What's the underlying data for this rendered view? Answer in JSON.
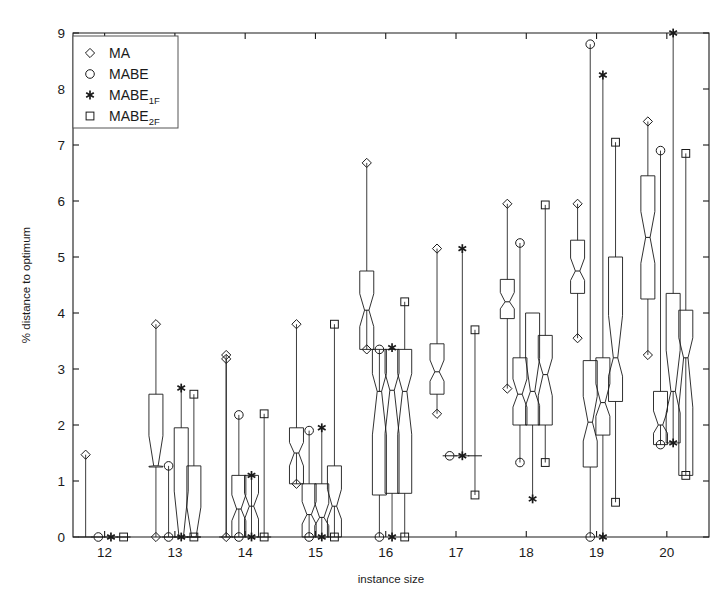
{
  "chart_data": {
    "type": "box",
    "title": "",
    "xlabel": "instance size",
    "ylabel": "% distance to optimum",
    "xlim": [
      11.55,
      20.6
    ],
    "ylim": [
      0,
      9
    ],
    "yticks": [
      0,
      1,
      2,
      3,
      4,
      5,
      6,
      7,
      8,
      9
    ],
    "xticks": [
      12,
      13,
      14,
      15,
      16,
      17,
      18,
      19,
      20
    ],
    "categories": [
      "12",
      "13",
      "14",
      "15",
      "16",
      "17",
      "18",
      "19",
      "20"
    ],
    "grid": false,
    "notched": true,
    "legend": {
      "position": "top-left",
      "entries": [
        {
          "label": "MA",
          "marker": "diamond",
          "sub": ""
        },
        {
          "label": "MABE",
          "marker": "circle",
          "sub": ""
        },
        {
          "label": "MABE",
          "marker": "asterisk",
          "sub": "1F"
        },
        {
          "label": "MABE",
          "marker": "square",
          "sub": "2F"
        }
      ]
    },
    "series": [
      {
        "name": "MA",
        "marker": "diamond",
        "offset": -0.27
      },
      {
        "name": "MABE",
        "marker": "circle",
        "offset": -0.09
      },
      {
        "name": "MABE_1F",
        "marker": "asterisk",
        "offset": 0.09
      },
      {
        "name": "MABE_2F",
        "marker": "square",
        "offset": 0.27
      }
    ],
    "boxes": [
      {
        "group": 12,
        "series": "MA",
        "q1": 0.0,
        "median": 0.0,
        "q3": 0.0,
        "wlo": 0.0,
        "whi": 0.0,
        "outliers": [
          1.47
        ]
      },
      {
        "group": 12,
        "series": "MABE",
        "q1": 0.0,
        "median": 0.0,
        "q3": 0.0,
        "wlo": 0.0,
        "whi": 0.0,
        "outliers": [
          0.0
        ]
      },
      {
        "group": 12,
        "series": "MABE_1F",
        "q1": 0.0,
        "median": 0.0,
        "q3": 0.0,
        "wlo": 0.0,
        "whi": 0.0,
        "outliers": [
          0.0
        ]
      },
      {
        "group": 12,
        "series": "MABE_2F",
        "q1": 0.0,
        "median": 0.0,
        "q3": 0.0,
        "wlo": 0.0,
        "whi": 0.0,
        "outliers": [
          0.0
        ]
      },
      {
        "group": 13,
        "series": "MA",
        "q1": 1.25,
        "median": 1.27,
        "q3": 2.55,
        "wlo": 0.0,
        "whi": 2.55,
        "outliers": [
          3.8,
          0.0
        ]
      },
      {
        "group": 13,
        "series": "MABE",
        "q1": 0.0,
        "median": 0.0,
        "q3": 0.0,
        "wlo": 0.0,
        "whi": 0.0,
        "outliers": [
          1.27,
          0.0
        ]
      },
      {
        "group": 13,
        "series": "MABE_1F",
        "q1": 0.0,
        "median": 0.0,
        "q3": 1.95,
        "wlo": 0.0,
        "whi": 1.95,
        "outliers": [
          2.66,
          0.0
        ]
      },
      {
        "group": 13,
        "series": "MABE_2F",
        "q1": 0.0,
        "median": 0.0,
        "q3": 1.27,
        "wlo": 0.0,
        "whi": 1.27,
        "outliers": [
          2.55,
          0.0
        ]
      },
      {
        "group": 14,
        "series": "MA",
        "q1": 0.0,
        "median": 0.0,
        "q3": 0.0,
        "wlo": 0.0,
        "whi": 0.0,
        "outliers": [
          3.25,
          3.18,
          0.0
        ]
      },
      {
        "group": 14,
        "series": "MABE",
        "q1": 0.0,
        "median": 0.5,
        "q3": 1.1,
        "wlo": 0.0,
        "whi": 1.1,
        "outliers": [
          2.18,
          0.0
        ]
      },
      {
        "group": 14,
        "series": "MABE_1F",
        "q1": 0.0,
        "median": 0.55,
        "q3": 1.1,
        "wlo": 0.0,
        "whi": 1.1,
        "outliers": [
          1.1,
          0.0
        ]
      },
      {
        "group": 14,
        "series": "MABE_2F",
        "q1": 0.0,
        "median": 0.0,
        "q3": 0.0,
        "wlo": 0.0,
        "whi": 0.0,
        "outliers": [
          2.2,
          0.0
        ]
      },
      {
        "group": 15,
        "series": "MA",
        "q1": 0.95,
        "median": 1.5,
        "q3": 1.95,
        "wlo": 0.95,
        "whi": 1.95,
        "outliers": [
          3.8,
          0.95
        ]
      },
      {
        "group": 15,
        "series": "MABE",
        "q1": 0.0,
        "median": 0.4,
        "q3": 0.95,
        "wlo": 0.0,
        "whi": 0.95,
        "outliers": [
          1.9,
          0.0
        ]
      },
      {
        "group": 15,
        "series": "MABE_1F",
        "q1": 0.0,
        "median": 0.35,
        "q3": 0.95,
        "wlo": 0.0,
        "whi": 0.95,
        "outliers": [
          1.95,
          0.0
        ]
      },
      {
        "group": 15,
        "series": "MABE_2F",
        "q1": 0.0,
        "median": 0.55,
        "q3": 1.27,
        "wlo": 0.0,
        "whi": 1.27,
        "outliers": [
          3.8,
          0.0
        ]
      },
      {
        "group": 16,
        "series": "MA",
        "q1": 3.35,
        "median": 4.05,
        "q3": 4.75,
        "wlo": 3.35,
        "whi": 4.75,
        "outliers": [
          6.68,
          3.35
        ]
      },
      {
        "group": 16,
        "series": "MABE",
        "q1": 0.75,
        "median": 2.6,
        "q3": 3.35,
        "wlo": 0.0,
        "whi": 3.35,
        "outliers": [
          3.35,
          0.0
        ]
      },
      {
        "group": 16,
        "series": "MABE_1F",
        "q1": 0.78,
        "median": 2.62,
        "q3": 3.35,
        "wlo": 0.0,
        "whi": 3.35,
        "outliers": [
          3.38,
          0.0
        ]
      },
      {
        "group": 16,
        "series": "MABE_2F",
        "q1": 0.78,
        "median": 2.6,
        "q3": 3.35,
        "wlo": 0.0,
        "whi": 3.35,
        "outliers": [
          4.2,
          0.0
        ]
      },
      {
        "group": 17,
        "series": "MA",
        "q1": 2.55,
        "median": 2.95,
        "q3": 3.45,
        "wlo": 2.55,
        "whi": 3.45,
        "outliers": [
          5.15,
          2.2
        ]
      },
      {
        "group": 17,
        "series": "MABE",
        "q1": 1.45,
        "median": 1.45,
        "q3": 1.45,
        "wlo": 1.45,
        "whi": 1.45,
        "outliers": [
          1.45
        ]
      },
      {
        "group": 17,
        "series": "MABE_1F",
        "q1": 1.45,
        "median": 1.45,
        "q3": 1.45,
        "wlo": 1.45,
        "whi": 1.45,
        "outliers": [
          5.15,
          1.45
        ]
      },
      {
        "group": 17,
        "series": "MABE_2F",
        "q1": 1.45,
        "median": 1.45,
        "q3": 1.45,
        "wlo": 1.45,
        "whi": 1.45,
        "outliers": [
          3.7,
          0.75
        ]
      },
      {
        "group": 18,
        "series": "MA",
        "q1": 3.9,
        "median": 4.2,
        "q3": 4.6,
        "wlo": 2.65,
        "whi": 4.6,
        "outliers": [
          5.95,
          2.65
        ]
      },
      {
        "group": 18,
        "series": "MABE",
        "q1": 2.0,
        "median": 2.55,
        "q3": 3.2,
        "wlo": 1.33,
        "whi": 3.2,
        "outliers": [
          5.25,
          1.33
        ]
      },
      {
        "group": 18,
        "series": "MABE_1F",
        "q1": 2.0,
        "median": 2.6,
        "q3": 4.0,
        "wlo": 0.68,
        "whi": 4.0,
        "outliers": [
          0.68
        ]
      },
      {
        "group": 18,
        "series": "MABE_2F",
        "q1": 2.0,
        "median": 2.9,
        "q3": 3.6,
        "wlo": 1.33,
        "whi": 3.6,
        "outliers": [
          5.93,
          1.33
        ]
      },
      {
        "group": 19,
        "series": "MA",
        "q1": 4.35,
        "median": 4.75,
        "q3": 5.3,
        "wlo": 3.55,
        "whi": 5.3,
        "outliers": [
          5.95,
          3.55
        ]
      },
      {
        "group": 19,
        "series": "MABE",
        "q1": 1.25,
        "median": 2.05,
        "q3": 3.15,
        "wlo": 0.0,
        "whi": 3.15,
        "outliers": [
          8.8,
          0.0
        ]
      },
      {
        "group": 19,
        "series": "MABE_1F",
        "q1": 1.82,
        "median": 2.4,
        "q3": 3.2,
        "wlo": 0.0,
        "whi": 3.2,
        "outliers": [
          8.25,
          0.0
        ]
      },
      {
        "group": 19,
        "series": "MABE_2F",
        "q1": 2.42,
        "median": 3.2,
        "q3": 5.0,
        "wlo": 0.62,
        "whi": 5.0,
        "outliers": [
          7.05,
          0.62
        ]
      },
      {
        "group": 20,
        "series": "MA",
        "q1": 4.25,
        "median": 5.35,
        "q3": 6.45,
        "wlo": 3.25,
        "whi": 6.45,
        "outliers": [
          7.42,
          3.25
        ]
      },
      {
        "group": 20,
        "series": "MABE",
        "q1": 1.65,
        "median": 2.0,
        "q3": 2.6,
        "wlo": 1.65,
        "whi": 2.6,
        "outliers": [
          6.9,
          1.65
        ]
      },
      {
        "group": 20,
        "series": "MABE_1F",
        "q1": 1.68,
        "median": 2.6,
        "q3": 4.35,
        "wlo": 1.68,
        "whi": 4.35,
        "outliers": [
          9.0,
          1.68
        ]
      },
      {
        "group": 20,
        "series": "MABE_2F",
        "q1": 1.1,
        "median": 3.2,
        "q3": 4.05,
        "wlo": 1.1,
        "whi": 4.05,
        "outliers": [
          6.85,
          1.1
        ]
      }
    ]
  }
}
